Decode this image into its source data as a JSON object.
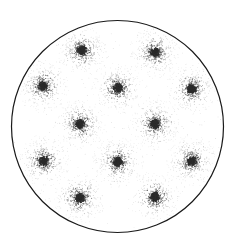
{
  "figure": {
    "kind": "stipple-diagram",
    "width": 237,
    "height": 246,
    "background_color": "#ffffff"
  },
  "aperture": {
    "name": "circular-boundary",
    "shape": "circle",
    "center_x": 117.5,
    "center_y": 126.5,
    "radius": 106,
    "stroke_color": "#1a1a1a",
    "stroke_width": 1.2,
    "fill_color": "#ffffff"
  },
  "stipple": {
    "dot_color": "#2b2b2b",
    "dot_radius_min": 0.35,
    "dot_radius_max": 0.72,
    "core_radius": 4.5,
    "halo_radius": 26,
    "dots_per_cluster": 620,
    "background_dots": 260,
    "random_seed": 20240517
  },
  "lattice": {
    "name": "hexagonal",
    "rows": 5,
    "cluster_count": 14,
    "spacing_x": 74,
    "spacing_y": 37,
    "clusters": [
      {
        "id": "c1",
        "label": "top-left",
        "x": 82,
        "y": 50
      },
      {
        "id": "c2",
        "label": "top-right",
        "x": 155,
        "y": 52
      },
      {
        "id": "c3",
        "label": "upper-far-left",
        "x": 43,
        "y": 86
      },
      {
        "id": "c4",
        "label": "upper-center",
        "x": 118,
        "y": 88
      },
      {
        "id": "c5",
        "label": "upper-far-right",
        "x": 192,
        "y": 89
      },
      {
        "id": "c6",
        "label": "middle-left",
        "x": 80,
        "y": 124
      },
      {
        "id": "c7",
        "label": "middle-right",
        "x": 155,
        "y": 124
      },
      {
        "id": "c8",
        "label": "lower-far-left",
        "x": 44,
        "y": 161
      },
      {
        "id": "c9",
        "label": "lower-center",
        "x": 118,
        "y": 162
      },
      {
        "id": "c10",
        "label": "lower-far-right",
        "x": 192,
        "y": 161
      },
      {
        "id": "c11",
        "label": "bottom-left",
        "x": 80,
        "y": 198
      },
      {
        "id": "c12",
        "label": "bottom-right",
        "x": 155,
        "y": 197
      }
    ]
  },
  "chart_data": {
    "type": "scatter",
    "xlabel": "",
    "ylabel": "",
    "xlim": [
      0,
      237
    ],
    "ylim": [
      0,
      246
    ],
    "grid": false,
    "legend": false,
    "series": [
      {
        "name": "dot-cluster-centers",
        "x": [
          82,
          155,
          43,
          118,
          192,
          80,
          155,
          44,
          118,
          192,
          80,
          155
        ],
        "y": [
          50,
          52,
          86,
          88,
          89,
          124,
          124,
          161,
          162,
          161,
          198,
          197
        ]
      }
    ],
    "annotations": []
  }
}
